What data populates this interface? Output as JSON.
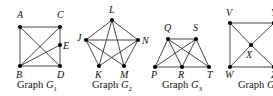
{
  "figure": {
    "colors": {
      "edge": "#333333",
      "node": "#000000",
      "text": "#111111",
      "background": "#ffffff"
    },
    "graphs": [
      {
        "id": "G1",
        "caption": {
          "prefix": "Graph ",
          "letter": "G",
          "subscript": "1"
        },
        "caption_pos": [
          37,
          88
        ],
        "vertices": [
          {
            "name": "A",
            "x": 20,
            "y": 27,
            "lx": 17,
            "ly": 18
          },
          {
            "name": "C",
            "x": 60,
            "y": 27,
            "lx": 57,
            "ly": 18
          },
          {
            "name": "E",
            "x": 60,
            "y": 45,
            "lx": 63,
            "ly": 49
          },
          {
            "name": "B",
            "x": 20,
            "y": 66,
            "lx": 16,
            "ly": 78
          },
          {
            "name": "D",
            "x": 60,
            "y": 66,
            "lx": 57,
            "ly": 78
          }
        ],
        "edges": [
          [
            "A",
            "C"
          ],
          [
            "A",
            "B"
          ],
          [
            "A",
            "D"
          ],
          [
            "C",
            "B"
          ],
          [
            "C",
            "E"
          ],
          [
            "E",
            "D"
          ],
          [
            "B",
            "E"
          ],
          [
            "B",
            "D"
          ]
        ]
      },
      {
        "id": "G2",
        "caption": {
          "prefix": "Graph ",
          "letter": "G",
          "subscript": "2"
        },
        "caption_pos": [
          112,
          88
        ],
        "vertices": [
          {
            "name": "L",
            "x": 112,
            "y": 20,
            "lx": 109,
            "ly": 13
          },
          {
            "name": "J",
            "x": 86,
            "y": 40,
            "lx": 77,
            "ly": 41
          },
          {
            "name": "N",
            "x": 138,
            "y": 40,
            "lx": 142,
            "ly": 44
          },
          {
            "name": "K",
            "x": 99,
            "y": 66,
            "lx": 95,
            "ly": 78
          },
          {
            "name": "M",
            "x": 124,
            "y": 66,
            "lx": 120,
            "ly": 78
          }
        ],
        "edges": [
          [
            "L",
            "J"
          ],
          [
            "L",
            "N"
          ],
          [
            "L",
            "K"
          ],
          [
            "L",
            "M"
          ],
          [
            "J",
            "N"
          ],
          [
            "J",
            "K"
          ],
          [
            "J",
            "M"
          ],
          [
            "N",
            "K"
          ],
          [
            "N",
            "M"
          ]
        ]
      },
      {
        "id": "G3",
        "caption": {
          "prefix": "Graph ",
          "letter": "G",
          "subscript": "3"
        },
        "caption_pos": [
          182,
          88
        ],
        "vertices": [
          {
            "name": "Q",
            "x": 168,
            "y": 39,
            "lx": 164,
            "ly": 31
          },
          {
            "name": "S",
            "x": 196,
            "y": 39,
            "lx": 193,
            "ly": 31
          },
          {
            "name": "P",
            "x": 155,
            "y": 67,
            "lx": 151,
            "ly": 78
          },
          {
            "name": "R",
            "x": 182,
            "y": 67,
            "lx": 178,
            "ly": 78
          },
          {
            "name": "T",
            "x": 209,
            "y": 67,
            "lx": 207,
            "ly": 78
          }
        ],
        "edges": [
          [
            "Q",
            "S"
          ],
          [
            "P",
            "R"
          ],
          [
            "R",
            "T"
          ],
          [
            "P",
            "Q"
          ],
          [
            "Q",
            "R"
          ],
          [
            "Q",
            "T"
          ],
          [
            "S",
            "P"
          ],
          [
            "S",
            "R"
          ],
          [
            "S",
            "T"
          ]
        ]
      },
      {
        "id": "G4",
        "caption": {
          "prefix": "Graph ",
          "letter": "G",
          "subscript": "4"
        },
        "caption_pos": [
          258,
          88
        ],
        "vertices": [
          {
            "name": "V",
            "x": 230,
            "y": 23,
            "lx": 226,
            "ly": 16
          },
          {
            "name": "Y",
            "x": 274,
            "y": 23,
            "lx": 271,
            "ly": 16
          },
          {
            "name": "X",
            "x": 251,
            "y": 45,
            "lx": 246,
            "ly": 58
          },
          {
            "name": "W",
            "x": 230,
            "y": 67,
            "lx": 225,
            "ly": 78
          },
          {
            "name": "Z",
            "x": 274,
            "y": 67,
            "lx": 271,
            "ly": 78
          }
        ],
        "edges": [
          [
            "V",
            "Y"
          ],
          [
            "V",
            "W"
          ],
          [
            "W",
            "Z"
          ],
          [
            "Y",
            "Z"
          ],
          [
            "V",
            "X"
          ],
          [
            "X",
            "Z"
          ],
          [
            "W",
            "X"
          ],
          [
            "X",
            "Y"
          ]
        ]
      }
    ]
  }
}
